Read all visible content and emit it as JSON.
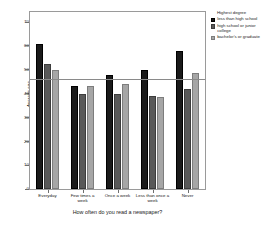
{
  "chart_data": {
    "type": "bar",
    "title": "",
    "xlabel": "How often do you read a newspaper?",
    "ylabel": "Average age",
    "categories": [
      "Everyday",
      "Few times a week",
      "Once a week",
      "Less than once a week",
      "Never"
    ],
    "series": [
      {
        "name": "less than high school",
        "color": "#1a1a1a",
        "values": [
          60.5,
          43.0,
          47.8,
          49.8,
          57.5
        ]
      },
      {
        "name": "high school or junior college",
        "color": "#595959",
        "values": [
          52.3,
          39.8,
          39.7,
          38.7,
          41.8
        ]
      },
      {
        "name": "bachelor's or graduate",
        "color": "#a6a6a6",
        "values": [
          49.8,
          43.2,
          44.0,
          38.3,
          48.5
        ]
      }
    ],
    "ylim": [
      0,
      74
    ],
    "yticks": [
      0,
      10,
      20,
      30,
      40,
      50,
      60,
      70
    ],
    "ytick_labels": [
      "0",
      "10",
      "20",
      "30",
      "40",
      "50",
      "60",
      "70"
    ],
    "grid": false,
    "reference_line": {
      "value": 46.0,
      "color": "#8a8a8a"
    },
    "legend": {
      "title": "Highest degree",
      "position": "right",
      "entries": [
        "less than high school",
        "high school or junior college",
        "bachelor's or graduate"
      ]
    }
  }
}
